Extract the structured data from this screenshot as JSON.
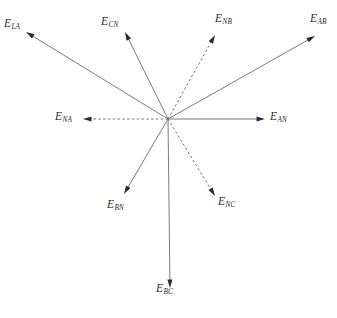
{
  "figure": {
    "type": "phasor-diagram",
    "background_color": "#ffffff",
    "line_color": "#6b6b6b",
    "arrow_color": "#2a2a2a",
    "label_color": "#2b2b2b",
    "width": 337,
    "height": 318,
    "origin": {
      "x": 168,
      "y": 119
    }
  },
  "chart_data": {
    "type": "scatter",
    "title": "",
    "xlabel": "",
    "ylabel": "",
    "grid": false,
    "legend": "none",
    "origin": {
      "x": 168,
      "y": 119
    },
    "vectors": [
      {
        "id": "E_LA",
        "symbol": "E",
        "subscript": "LA",
        "style": "solid",
        "tip": {
          "x": 26,
          "y": 32
        },
        "angle_deg": 148.5,
        "length_px": 172
      },
      {
        "id": "E_CN",
        "symbol": "E",
        "subscript": "CN",
        "style": "solid",
        "tip": {
          "x": 125,
          "y": 32
        },
        "angle_deg": 116.3,
        "length_px": 96
      },
      {
        "id": "E_NB",
        "symbol": "E",
        "subscript": "NB",
        "style": "dashed",
        "tip": {
          "x": 215,
          "y": 35
        },
        "angle_deg": 59.1,
        "length_px": 97
      },
      {
        "id": "E_AB",
        "symbol": "E",
        "subscript": "AB",
        "style": "solid",
        "tip": {
          "x": 315,
          "y": 36
        },
        "angle_deg": 29.2,
        "length_px": 168
      },
      {
        "id": "E_NA",
        "symbol": "E",
        "subscript": "NA",
        "style": "dashed",
        "tip": {
          "x": 83,
          "y": 119
        },
        "angle_deg": 180,
        "length_px": 85
      },
      {
        "id": "E_AN",
        "symbol": "E",
        "subscript": "AN",
        "style": "solid",
        "tip": {
          "x": 265,
          "y": 119
        },
        "angle_deg": 0,
        "length_px": 97
      },
      {
        "id": "E_BN",
        "symbol": "E",
        "subscript": "BN",
        "style": "solid",
        "tip": {
          "x": 124,
          "y": 194
        },
        "angle_deg": -120.4,
        "length_px": 87
      },
      {
        "id": "E_NC",
        "symbol": "E",
        "subscript": "NC",
        "style": "dashed",
        "tip": {
          "x": 215,
          "y": 196
        },
        "angle_deg": -58.6,
        "length_px": 90
      },
      {
        "id": "E_BC",
        "symbol": "E",
        "subscript": "BC",
        "style": "solid",
        "tip": {
          "x": 170,
          "y": 288
        },
        "angle_deg": -89.3,
        "length_px": 169
      }
    ]
  },
  "labels": [
    {
      "id": "label-E-LA",
      "symbol": "E",
      "subscript": "LA",
      "x": 4,
      "y": 18
    },
    {
      "id": "label-E-CN",
      "symbol": "E",
      "subscript": "CN",
      "x": 101,
      "y": 16
    },
    {
      "id": "label-E-NB",
      "symbol": "E",
      "subscript": "NB",
      "x": 215,
      "y": 13
    },
    {
      "id": "label-E-AB",
      "symbol": "E",
      "subscript": "AB",
      "x": 310,
      "y": 13
    },
    {
      "id": "label-E-NA",
      "symbol": "E",
      "subscript": "NA",
      "x": 55,
      "y": 111
    },
    {
      "id": "label-E-AN",
      "symbol": "E",
      "subscript": "AN",
      "x": 270,
      "y": 111
    },
    {
      "id": "label-E-BN",
      "symbol": "E",
      "subscript": "BN",
      "x": 107,
      "y": 199
    },
    {
      "id": "label-E-NC",
      "symbol": "E",
      "subscript": "NC",
      "x": 218,
      "y": 196
    },
    {
      "id": "label-E-BC",
      "symbol": "E",
      "subscript": "BC",
      "x": 156,
      "y": 283
    }
  ]
}
